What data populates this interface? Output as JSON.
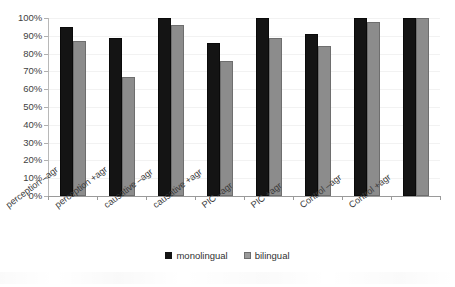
{
  "chart_data": {
    "type": "bar",
    "title": "",
    "xlabel": "",
    "ylabel": "",
    "ylim": [
      0,
      100
    ],
    "grid": true,
    "legend_position": "bottom-center",
    "categories": [
      "perception –agr",
      "perception +agr",
      "causative –agr",
      "causative +agr",
      "PIC –agr",
      "PIC +agr",
      "Control –agr",
      "Control +agr"
    ],
    "ytick_labels": [
      "100%",
      "90%",
      "80%",
      "70%",
      "60%",
      "50%",
      "40%",
      "30%",
      "20%",
      "10%",
      "0%"
    ],
    "ytick_values": [
      100,
      90,
      80,
      70,
      60,
      50,
      40,
      30,
      20,
      10,
      0
    ],
    "series": [
      {
        "name": "monolingual",
        "color": "#141414",
        "values": [
          95,
          89,
          100,
          86,
          100,
          91,
          100,
          100
        ]
      },
      {
        "name": "bilingual",
        "color": "#8c8c8c",
        "values": [
          87,
          67,
          96,
          76,
          89,
          84,
          98,
          100
        ]
      }
    ]
  },
  "legend": {
    "items": [
      {
        "label": "monolingual",
        "marker": "filled-square-black"
      },
      {
        "label": "bilingual",
        "marker": "filled-square-gray"
      }
    ]
  }
}
